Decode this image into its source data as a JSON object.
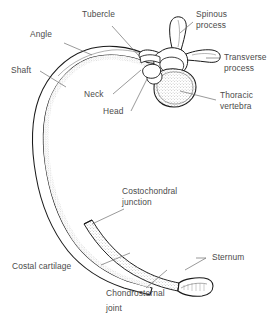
{
  "figure": {
    "background_color": "#ffffff",
    "ink_color": "#1a1a1a",
    "label_color": "#4b4b4b",
    "leader_color": "#6e6e6e",
    "stipple_color": "#8a8a8a"
  },
  "labels": {
    "tubercle": "Tubercle",
    "angle": "Angle",
    "shaft": "Shaft",
    "neck": "Neck",
    "head": "Head",
    "spinous_process_line1": "Spinous",
    "spinous_process_line2": "process",
    "transverse_process_line1": "Transverse",
    "transverse_process_line2": "process",
    "thoracic_vertebra_line1": "Thoracic",
    "thoracic_vertebra_line2": "vertebra",
    "costochondral_junction_line1": "Costochondral",
    "costochondral_junction_line2": "junction",
    "costal_cartilage": "Costal cartilage",
    "sternum": "Sternum",
    "chondrosternal_joint_line1": "Chondrosternal",
    "chondrosternal_joint_line2": "joint"
  }
}
